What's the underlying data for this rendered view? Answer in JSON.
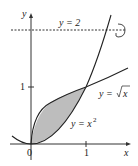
{
  "figure": {
    "axis_labels": {
      "x": "x",
      "y": "y"
    },
    "ticks": {
      "origin": "0",
      "x1": "1",
      "y1": "1"
    },
    "curves": {
      "line": "y = 2",
      "sqrt_prefix": "y = ",
      "sqrt_arg": "x",
      "parabola_prefix": "y = x",
      "parabola_exp": "2"
    },
    "colors": {
      "curve": "#222222",
      "shade": "#bdbdbd",
      "axis": "#333333"
    }
  }
}
